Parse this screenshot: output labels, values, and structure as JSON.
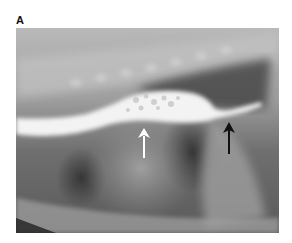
{
  "figure": {
    "panel_label": "A",
    "image_type": "lateral thoracic radiograph with contrast-filled esophagus",
    "annotations": [
      {
        "type": "arrow",
        "color": "#ffffff",
        "direction": "up"
      },
      {
        "type": "arrow",
        "color": "#000000",
        "direction": "up"
      }
    ]
  }
}
